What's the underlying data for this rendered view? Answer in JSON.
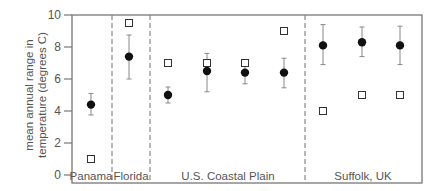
{
  "chart_data": {
    "type": "scatter",
    "title": "",
    "xlabel": "",
    "ylabel": "mean annual range in temperature (degrees C)",
    "ylabel_lines": [
      "mean annual range in",
      "temperature (degrees C)"
    ],
    "ylim": [
      0,
      10
    ],
    "yticks": [
      0,
      2,
      4,
      6,
      8,
      10
    ],
    "grid": false,
    "legend": null,
    "groups": [
      {
        "label": "Panama",
        "n_points": 1
      },
      {
        "label": "Florida",
        "n_points": 1
      },
      {
        "label": "U.S. Coastal Plain",
        "n_points": 4
      },
      {
        "label": "Suffolk, UK",
        "n_points": 3
      }
    ],
    "categories": [
      "Panama",
      "Florida",
      "U.S. Coastal Plain 1",
      "U.S. Coastal Plain 2",
      "U.S. Coastal Plain 3",
      "U.S. Coastal Plain 4",
      "Suffolk, UK 1",
      "Suffolk, UK 2",
      "Suffolk, UK 3"
    ],
    "series": [
      {
        "name": "filled circles (mean with error bars)",
        "marker": "filled-circle",
        "values": [
          4.4,
          7.4,
          5.0,
          6.5,
          6.4,
          6.4,
          8.1,
          8.3,
          8.1
        ],
        "error_low": [
          3.75,
          6.0,
          4.5,
          5.2,
          5.7,
          5.45,
          6.9,
          7.4,
          6.9
        ],
        "error_high": [
          5.1,
          8.75,
          5.5,
          7.6,
          7.0,
          7.3,
          9.4,
          9.25,
          9.3
        ]
      },
      {
        "name": "open squares",
        "marker": "open-square",
        "values": [
          1.0,
          9.5,
          7.0,
          7.0,
          7.0,
          9.0,
          4.0,
          5.0,
          5.0
        ]
      }
    ],
    "group_dividers": "dashed vertical lines"
  },
  "layout": {
    "plot": {
      "left": 72,
      "right": 422,
      "top": 15,
      "bottom": 183,
      "y0": 175,
      "px_per_unit": 16
    },
    "x_positions": [
      91,
      129,
      168,
      207,
      245,
      284,
      323,
      362,
      400
    ],
    "dividers": [
      112,
      150,
      305
    ],
    "group_label_x": [
      91,
      131,
      228,
      363
    ],
    "colors": {
      "axis": "#777777",
      "text": "#555555",
      "marker": "#111111",
      "errorbar": "#888888"
    }
  }
}
